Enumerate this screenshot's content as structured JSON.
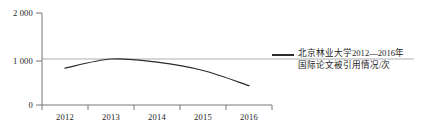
{
  "chart_data": {
    "type": "line",
    "title": "",
    "subtitle": "",
    "xlabel": "",
    "ylabel": "",
    "categories": [
      "2012",
      "2013",
      "2014",
      "2015",
      "2016"
    ],
    "series": [
      {
        "name": "北京林业大学2012—2016年国际论文被引用情况/次",
        "values": [
          800,
          1000,
          930,
          750,
          420
        ],
        "color": "#2b2b2b"
      }
    ],
    "ylim": [
      0,
      2000
    ],
    "y_ticks": [
      0,
      1000,
      2000
    ],
    "y_tick_labels": [
      "0",
      "1 000",
      "2 000"
    ],
    "x_tick_labels": [
      "2012",
      "2013",
      "2014",
      "2015",
      "2016"
    ],
    "grid": true,
    "gridlines_y": [
      1000
    ],
    "legend_position": "right",
    "legend_entries": [
      {
        "label_line_1": "北京林业大学2012—2016年",
        "label_line_2": "国际论文被引用情况/次",
        "color": "#2b2b2b"
      }
    ],
    "axis_color": "#6a6a6a",
    "line_color": "#2b2b2b",
    "background": "#ffffff"
  }
}
